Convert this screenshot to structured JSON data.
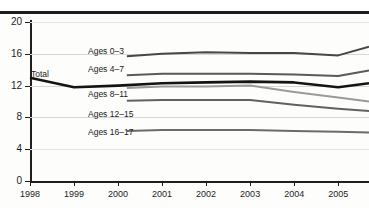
{
  "header": {
    "title": "",
    "has_top_rule": true
  },
  "chart_data": {
    "type": "line",
    "title": "",
    "xlabel": "",
    "ylabel": "",
    "x": [
      1998,
      1999,
      2000,
      2001,
      2002,
      2003,
      2004,
      2005
    ],
    "xtick_labels": [
      "1998",
      "1999",
      "2000",
      "2001",
      "2002",
      "2003",
      "2004",
      "2005"
    ],
    "ytick_labels": [
      "0",
      "4",
      "8",
      "12",
      "16",
      "20"
    ],
    "ytick_values": [
      0,
      4,
      8,
      12,
      16,
      20
    ],
    "ylim": [
      0,
      20
    ],
    "xlim": [
      1998,
      2005.7
    ],
    "grid": true,
    "legend": "inline-labels",
    "series": [
      {
        "name": "Total",
        "label": "Total",
        "color": "#141414",
        "width": 2.6,
        "x": [
          1998,
          1999,
          2000,
          2001,
          2002,
          2003,
          2004,
          2005,
          2005.7
        ],
        "values": [
          13.0,
          11.8,
          12.0,
          12.3,
          12.4,
          12.5,
          12.4,
          11.8,
          12.3
        ]
      },
      {
        "name": "Ages 0-3",
        "label": "Ages 0–3",
        "color": "#474747",
        "width": 2.0,
        "x": [
          2000.2,
          2001,
          2002,
          2003,
          2004,
          2005,
          2005.7
        ],
        "values": [
          15.7,
          16.0,
          16.2,
          16.1,
          16.1,
          15.8,
          16.9
        ]
      },
      {
        "name": "Ages 4-7",
        "label": "Ages 4–7",
        "color": "#5a5a5a",
        "width": 2.0,
        "x": [
          2000.2,
          2001,
          2002,
          2003,
          2004,
          2005,
          2005.7
        ],
        "values": [
          13.3,
          13.5,
          13.5,
          13.5,
          13.4,
          13.2,
          13.9
        ]
      },
      {
        "name": "Ages 8-11",
        "label": "Ages 8–11",
        "color": "#9a9a9a",
        "width": 2.0,
        "x": [
          2000.2,
          2001,
          2002,
          2003,
          2004,
          2005,
          2005.7
        ],
        "values": [
          11.7,
          11.9,
          11.9,
          12.0,
          11.2,
          10.5,
          10.0
        ]
      },
      {
        "name": "Ages 12-15",
        "label": "Ages 12–15",
        "color": "#616161",
        "width": 2.0,
        "x": [
          2000.2,
          2001,
          2002,
          2003,
          2004,
          2005,
          2005.7
        ],
        "values": [
          10.1,
          10.2,
          10.2,
          10.2,
          9.6,
          9.1,
          8.8
        ]
      },
      {
        "name": "Ages 16-17",
        "label": "Ages 16–17",
        "color": "#6b6b6b",
        "width": 2.0,
        "x": [
          2000.2,
          2001,
          2002,
          2003,
          2004,
          2005,
          2005.7
        ],
        "values": [
          6.3,
          6.4,
          6.4,
          6.4,
          6.3,
          6.2,
          6.1
        ]
      }
    ]
  },
  "colors": {
    "axis": "#1f1f1f",
    "grid": "#d9d6cf",
    "total_line": "#141414",
    "background": "#fdfdfc"
  }
}
